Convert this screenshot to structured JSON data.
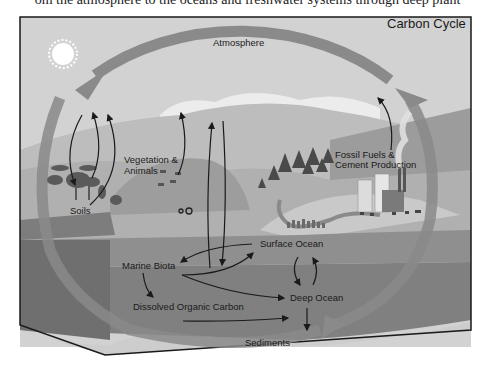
{
  "page": {
    "clipped_caption": "om the atmosphere to the oceans and freshwater systems through deep plant"
  },
  "diagram": {
    "title": "Carbon Cycle",
    "labels": {
      "atmosphere": "Atmosphere",
      "vegetation_line1": "Vegetation &",
      "vegetation_line2": "Animals",
      "soils": "Soils",
      "fossil_line1": "Fossil Fuels &",
      "fossil_line2": "Cement Production",
      "surface_ocean": "Surface Ocean",
      "marine_biota": "Marine Biota",
      "deep_ocean": "Deep Ocean",
      "dissolved_organic_carbon": "Dissolved Organic Carbon",
      "sediments": "Sediments"
    },
    "flows": [
      {
        "from": "Soils/Vegetation",
        "to": "Atmosphere"
      },
      {
        "from": "Atmosphere",
        "to": "Vegetation & Animals"
      },
      {
        "from": "Vegetation & Animals",
        "to": "Atmosphere"
      },
      {
        "from": "Atmosphere",
        "to": "Surface Ocean"
      },
      {
        "from": "Surface Ocean",
        "to": "Atmosphere"
      },
      {
        "from": "Fossil Fuels & Cement Production",
        "to": "Atmosphere"
      },
      {
        "from": "Surface Ocean",
        "to": "Marine Biota"
      },
      {
        "from": "Marine Biota",
        "to": "Surface Ocean"
      },
      {
        "from": "Marine Biota",
        "to": "Dissolved Organic Carbon"
      },
      {
        "from": "Marine Biota",
        "to": "Deep Ocean"
      },
      {
        "from": "Surface Ocean",
        "to": "Deep Ocean"
      },
      {
        "from": "Deep Ocean",
        "to": "Surface Ocean"
      },
      {
        "from": "Dissolved Organic Carbon",
        "to": "Deep Ocean"
      },
      {
        "from": "Deep Ocean",
        "to": "Sediments"
      }
    ],
    "colors": {
      "sky": "#d2d2d2",
      "cloud": "#ececec",
      "hill_far": "#b8b8b8",
      "land": "#a9a9a9",
      "ocean_surface": "#8e8e8e",
      "ocean_deep": "#7e7e7e",
      "block_side": "#6e6e6e",
      "big_arrow": "#8a8a8a",
      "sediment": "#cfcfcf",
      "frame": "#1a1a1a"
    }
  }
}
